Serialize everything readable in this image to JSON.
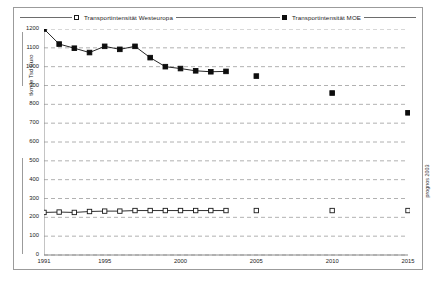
{
  "legend": {
    "entries": [
      {
        "label": "Transportintensität Westeuropa",
        "marker": "open-square",
        "color": "#1a1a1a"
      },
      {
        "label": "Transportintensität MOE",
        "marker": "filled-square",
        "color": "#0d0d0d"
      }
    ]
  },
  "source_note": "prognos 2003",
  "chart_data": {
    "type": "line",
    "title": "",
    "subtitle": "",
    "xlabel": "",
    "ylabel": "tkm je Tsd Euro",
    "xlim": [
      1991,
      2015
    ],
    "ylim": [
      0,
      1200
    ],
    "ytick_step": 100,
    "yticks": [
      0,
      100,
      200,
      300,
      400,
      500,
      600,
      700,
      800,
      900,
      1000,
      1100,
      1200
    ],
    "ytick_labels": [
      "0",
      "100",
      "200",
      "300",
      "400",
      "500",
      "600",
      "700",
      "800",
      "900",
      "1000",
      "1100",
      "1200"
    ],
    "xticks": [
      1991,
      1995,
      2000,
      2005,
      2010,
      2015
    ],
    "xtick_labels": [
      "1991",
      "1995",
      "2000",
      "2005",
      "2010",
      "2015"
    ],
    "grid": true,
    "grid_style": "dashed-horizontal",
    "legend_position": "top",
    "series": [
      {
        "name": "Transportintensität Westeuropa",
        "marker": "open-square",
        "color": "#1a1a1a",
        "x": [
          1991,
          1992,
          1993,
          1994,
          1995,
          1996,
          1997,
          1998,
          1999,
          2000,
          2001,
          2002,
          2003
        ],
        "values": [
          226,
          228,
          226,
          231,
          233,
          233,
          236,
          236,
          236,
          236,
          236,
          236,
          236
        ],
        "forecast_x": [
          2005,
          2010,
          2015
        ],
        "forecast_values": [
          236,
          236,
          236
        ]
      },
      {
        "name": "Transportintensität MOE",
        "marker": "filled-square",
        "color": "#0d0d0d",
        "x": [
          1991,
          1992,
          1993,
          1994,
          1995,
          1996,
          1997,
          1998,
          1999,
          2000,
          2001,
          2002,
          2003
        ],
        "values": [
          1200,
          1120,
          1098,
          1075,
          1108,
          1092,
          1108,
          1048,
          1000,
          990,
          978,
          973,
          975
        ],
        "forecast_x": [
          2005,
          2010,
          2015
        ],
        "forecast_values": [
          950,
          860,
          755
        ]
      }
    ]
  }
}
